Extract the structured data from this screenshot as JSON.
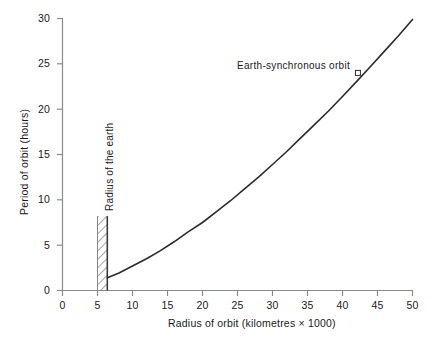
{
  "chart_data": {
    "type": "line",
    "title": "",
    "xlabel": "Radius of orbit (kilometres × 1000)",
    "ylabel": "Period of orbit (hours)",
    "xlim": [
      0,
      50
    ],
    "ylim": [
      0,
      30
    ],
    "xticks": [
      0,
      5,
      10,
      15,
      20,
      25,
      30,
      35,
      40,
      45,
      50
    ],
    "yticks": [
      0,
      5,
      10,
      15,
      20,
      25,
      30
    ],
    "xtick_labels": [
      "0",
      "5",
      "10",
      "15",
      "20",
      "25",
      "30",
      "35",
      "40",
      "45",
      "50"
    ],
    "ytick_labels": [
      "0",
      "5",
      "10",
      "15",
      "20",
      "25",
      "30"
    ],
    "grid": false,
    "legend": false,
    "series": [
      {
        "name": "Orbital period vs radius",
        "relation": "Kepler third law: T = 0.0846 * r^1.5 hours, r in 1000 km",
        "x": [
          6.4,
          8,
          10,
          12,
          14,
          16,
          18,
          20,
          22,
          24,
          26,
          28,
          30,
          32,
          34,
          36,
          38,
          40,
          42.2,
          44,
          46,
          48,
          50
        ],
        "values": [
          1.4,
          1.9,
          2.7,
          3.5,
          4.4,
          5.4,
          6.5,
          7.5,
          8.7,
          9.9,
          11.2,
          12.5,
          13.9,
          15.3,
          16.8,
          18.3,
          19.8,
          21.4,
          23.2,
          24.7,
          26.4,
          28.1,
          29.9
        ]
      }
    ],
    "annotations": [
      {
        "name": "earth-synchronous-orbit",
        "label": "Earth-synchronous orbit",
        "x": 42.2,
        "y": 24,
        "marker": "open-square"
      },
      {
        "name": "radius-of-the-earth",
        "label": "Radius of the earth",
        "x_start": 5.0,
        "x_end": 6.4,
        "y_top": 8.2,
        "style": "hatched-band"
      }
    ]
  },
  "colors": {
    "curve": "#2b2b2b",
    "axis": "#8a8a8a",
    "text": "#1a1a1a",
    "hatch": "#4d4d4d",
    "background": "#ffffff"
  }
}
